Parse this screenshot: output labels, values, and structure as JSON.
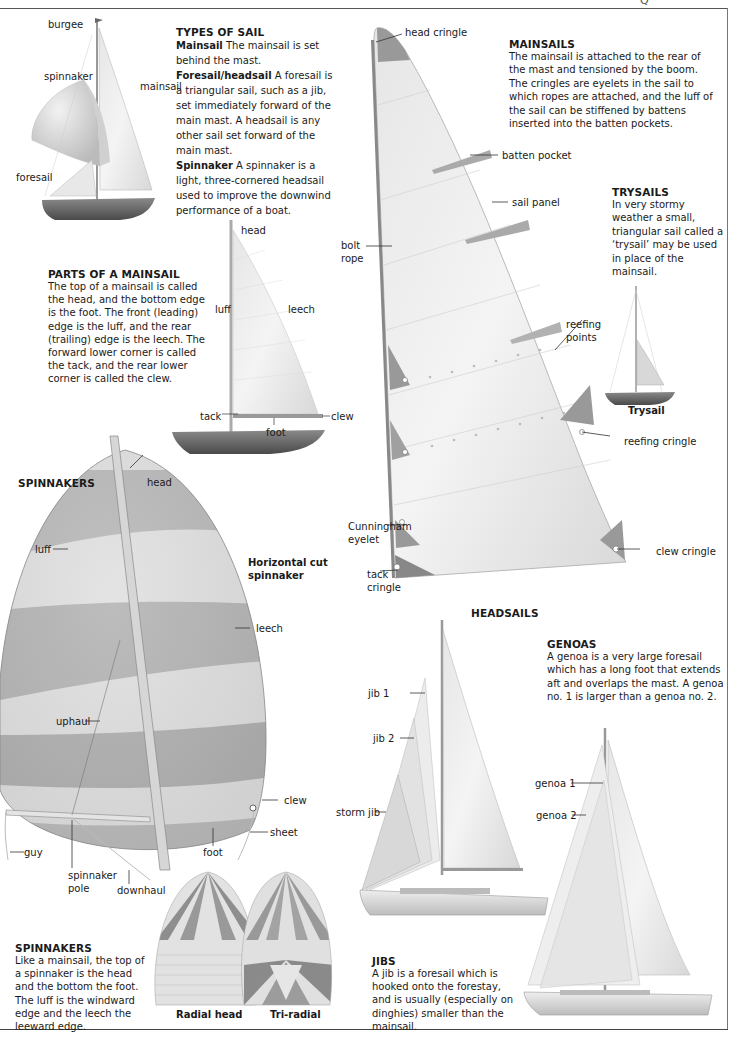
{
  "page": {
    "corner_mark": "Q"
  },
  "types_of_sail": {
    "title": "TYPES OF SAIL",
    "entries": [
      {
        "term": "Mainsail",
        "text": " The mainsail is set behind the mast."
      },
      {
        "term": "Foresail/headsail",
        "text": " A foresail is a triangular sail, such as a jib, set immediately forward of the main mast. A headsail is any other sail set forward of the main mast."
      },
      {
        "term": "Spinnaker",
        "text": " A spinnaker is a light, three-cornered headsail used to improve the downwind performance of a boat."
      }
    ],
    "labels": {
      "burgee": "burgee",
      "spinnaker": "spinnaker",
      "mainsail": "mainsail",
      "foresail": "foresail"
    }
  },
  "parts_of_mainsail": {
    "title": "PARTS OF A MAINSAIL",
    "text": "The top of a mainsail is called the head, and the bottom edge is the foot. The front (leading) edge is the luff, and the rear (trailing) edge is the leech. The forward lower corner is called the tack, and the rear lower corner is called the clew.",
    "labels": {
      "head": "head",
      "luff": "luff",
      "leech": "leech",
      "tack": "tack",
      "foot": "foot",
      "clew": "clew"
    }
  },
  "mainsails": {
    "title": "MAINSAILS",
    "text": "The mainsail is attached to the rear of the mast and tensioned by the boom. The cringles are eyelets in the sail to which ropes are attached, and the luff of the sail can be stiffened by battens inserted into the batten pockets.",
    "labels": {
      "head_cringle": "head cringle",
      "batten_pocket": "batten pocket",
      "sail_panel": "sail panel",
      "bolt_rope_1": "bolt",
      "bolt_rope_2": "rope",
      "reefing_points_1": "reefing",
      "reefing_points_2": "points",
      "reefing_cringle": "reefing cringle",
      "cunningham_1": "Cunningham",
      "cunningham_2": "eyelet",
      "tack_cringle_1": "tack",
      "tack_cringle_2": "cringle",
      "clew_cringle": "clew cringle"
    }
  },
  "trysails": {
    "title": "TRYSAILS",
    "text": "In very stormy weather a small, triangular sail called a ‘trysail’ may be used in place of the mainsail.",
    "caption": "Trysail"
  },
  "spinnakers_diagram": {
    "title": "SPINNAKERS",
    "caption_1": "Horizontal cut",
    "caption_2": "spinnaker",
    "labels": {
      "head": "head",
      "luff": "luff",
      "leech": "leech",
      "uphaul": "uphaul",
      "clew": "clew",
      "sheet": "sheet",
      "foot": "foot",
      "guy": "guy",
      "spinnaker_pole_1": "spinnaker",
      "spinnaker_pole_2": "pole",
      "downhaul": "downhaul"
    },
    "stripe_colors": {
      "dark": "#9a9a9a",
      "light": "#dcdcdc"
    }
  },
  "spinnakers_text": {
    "title": "SPINNAKERS",
    "text": "Like a mainsail, the top of a spinnaker is the head and the bottom the foot. The luff is the windward edge and the leech the leeward edge.",
    "captions": [
      "Radial head",
      "Tri-radial"
    ]
  },
  "headsails": {
    "title": "HEADSAILS",
    "labels": {
      "jib_1": "jib 1",
      "jib_2": "jib 2",
      "storm_jib": "storm jib",
      "genoa_1": "genoa 1",
      "genoa_2": "genoa 2"
    }
  },
  "genoas": {
    "title": "GENOAS",
    "text": "A genoa is a very large foresail which has a long foot that extends aft and overlaps the mast. A genoa no. 1 is larger than a genoa no. 2."
  },
  "jibs": {
    "title": "JIBS",
    "text": "A jib is a foresail which is hooked onto the forestay, and is usually (especially on dinghies) smaller than the mainsail."
  }
}
